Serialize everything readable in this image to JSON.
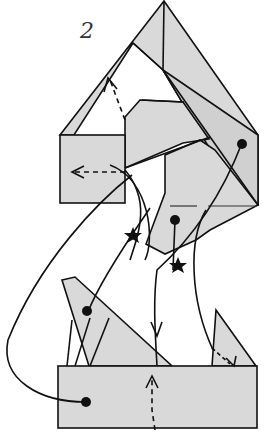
{
  "diagram": {
    "type": "origami folding step",
    "step_number": "2",
    "colors": {
      "paper": "#d9d9d9",
      "line": "#111111",
      "background": "#ffffff"
    },
    "symbols": [
      "solid-line",
      "dashed-arrow",
      "dot",
      "star",
      "arrow-head"
    ],
    "star_count": 2,
    "dot_count": 5
  }
}
